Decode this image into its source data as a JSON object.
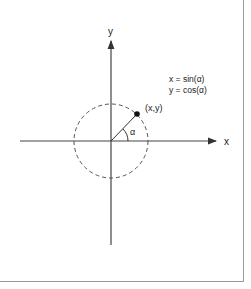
{
  "diagram": {
    "axes": {
      "x_label": "x",
      "y_label": "y"
    },
    "point_label": "(x,y)",
    "angle_label": "α",
    "equations": {
      "line1": "x = sin(α)",
      "line2": "y = cos(α)"
    },
    "colors": {
      "line": "#333333",
      "circle": "#555555",
      "frame": "#9a9a9a"
    }
  }
}
